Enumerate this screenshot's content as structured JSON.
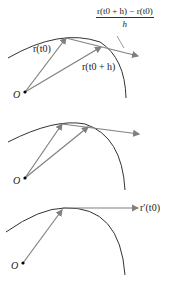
{
  "diagram": {
    "panels": [
      {
        "id": "secant",
        "origin_label": "O",
        "vector_labels": [
          "r(t0)",
          "r(t0 + h)"
        ],
        "difference_quotient": {
          "numerator": "r(t0 + h) − r(t0)",
          "denominator": "h"
        }
      },
      {
        "id": "secant-smaller-h",
        "origin_label": "O"
      },
      {
        "id": "tangent",
        "origin_label": "O",
        "vector_labels": [
          "r′(t0)"
        ]
      }
    ],
    "colors": {
      "curve": "#333333",
      "vector": "#808080",
      "text": "#222222"
    }
  }
}
